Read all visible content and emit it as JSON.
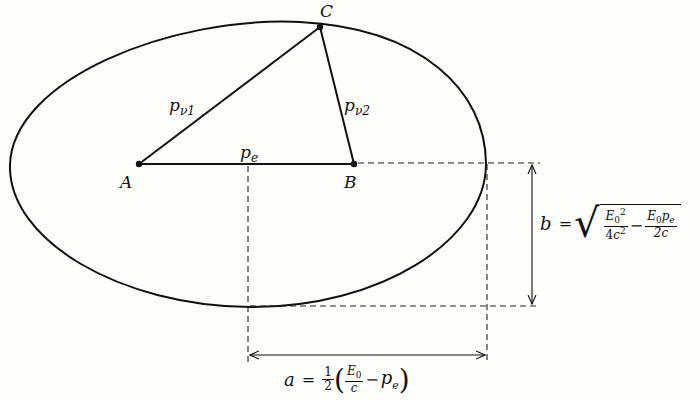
{
  "diagram": {
    "type": "ellipse-momentum-construction",
    "points": {
      "A": {
        "label": "A"
      },
      "B": {
        "label": "B"
      },
      "C": {
        "label": "C"
      }
    },
    "segments": {
      "AC": {
        "label_base": "p",
        "label_sub": "ν1"
      },
      "BC": {
        "label_base": "p",
        "label_sub": "ν2"
      },
      "AB": {
        "label_base": "p",
        "label_sub": "e"
      }
    },
    "semi_major_axis": {
      "symbol": "a",
      "equals": "=",
      "coef_num": "1",
      "coef_den": "2",
      "open_paren": "(",
      "frac_num_base": "E",
      "frac_num_sub": "0",
      "frac_den": "c",
      "minus": "−",
      "term_base": "p",
      "term_sub": "e",
      "close_paren": ")"
    },
    "semi_minor_axis": {
      "symbol": "b",
      "equals": "=",
      "radical": "√",
      "t1_num_base": "E",
      "t1_num_sub": "0",
      "t1_num_sup": "2",
      "t1_den_coef": "4",
      "t1_den_base": "c",
      "t1_den_sup": "2",
      "minus": "−",
      "t2_num_base": "E",
      "t2_num_sub": "0",
      "t2_num_tail": "p",
      "t2_num_tail_sub": "e",
      "t2_den": "2c"
    },
    "colors": {
      "ink": "#111111",
      "background": "#fdfdfc"
    }
  }
}
